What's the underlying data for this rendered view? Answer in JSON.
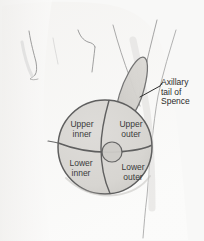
{
  "figure": {
    "name": "breast-quadrants-diagram",
    "background_color": "#f8f8f7",
    "ink_color": "#6b6b6b",
    "label_color": "#3a3a3a",
    "breast_fill": "#d8d6d3",
    "axillary_tail_fill": "#cfcdc9",
    "skin_shade": "#f0efed"
  },
  "quadrants": [
    {
      "id": "upper-inner",
      "line1": "Upper",
      "line2": "inner"
    },
    {
      "id": "upper-outer",
      "line1": "Upper",
      "line2": "outer"
    },
    {
      "id": "lower-inner",
      "line1": "Lower",
      "line2": "inner"
    },
    {
      "id": "lower-outer",
      "line1": "Lower",
      "line2": "outer"
    }
  ],
  "callout": {
    "id": "axillary-tail-of-spence",
    "line1": "Axillary",
    "line2": "tail of",
    "line3": "Spence",
    "leader_from": "140,97",
    "leader_to": "160,86"
  },
  "anatomy_parts": [
    {
      "name": "torso-chest-outline"
    },
    {
      "name": "neck-left-line"
    },
    {
      "name": "neck-right-line"
    },
    {
      "name": "shoulder-clavicle-line"
    },
    {
      "name": "arm-inner-contour"
    },
    {
      "name": "arm-outer-contour"
    },
    {
      "name": "breast-circle"
    },
    {
      "name": "quadrant-vertical-divider"
    },
    {
      "name": "quadrant-horizontal-divider"
    },
    {
      "name": "nipple-areola-circle"
    },
    {
      "name": "axillary-tail-shape"
    }
  ]
}
